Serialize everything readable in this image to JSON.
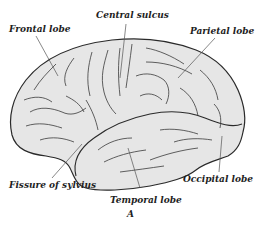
{
  "figure": {
    "caption": "A",
    "colors": {
      "fill": "#e6e6e6",
      "outline": "#2a2a2a",
      "sulci": "#3a3a3a",
      "leader": "#555555",
      "text": "#1e1e1e"
    }
  },
  "labels": {
    "frontal": "Frontal lobe",
    "central": "Central sulcus",
    "parietal": "Parietal lobe",
    "sylvius": "Fissure of sylvius",
    "temporal": "Temporal lobe",
    "occipital": "Occipital lobe"
  }
}
